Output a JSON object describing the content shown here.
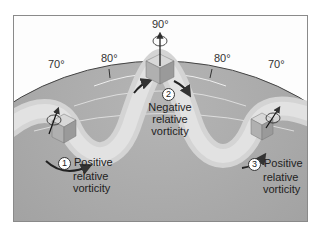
{
  "diagram": {
    "latitudes": {
      "left_70": "70°",
      "left_80": "80°",
      "top_90": "90°",
      "right_80": "80°",
      "right_70": "70°"
    },
    "points": [
      {
        "number": "1",
        "line1": "Positive",
        "line2": "relative",
        "line3": "vorticity"
      },
      {
        "number": "2",
        "line1": "Negative",
        "line2": "relative",
        "line3": "vorticity"
      },
      {
        "number": "3",
        "line1": "Positive",
        "line2": "relative",
        "line3": "vorticity"
      }
    ],
    "colors": {
      "sphere": "#9a9a9a",
      "sphere_light": "#b8b8b8",
      "flow_band": "#d6d6d6",
      "cube": "#c8c8c8",
      "arrow": "#333333",
      "frame": "#8a8a8a"
    }
  }
}
